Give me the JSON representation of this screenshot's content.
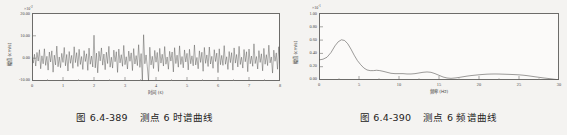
{
  "figures": [
    {
      "caption_number": "图 6.4-389",
      "caption_text": "测点 6 时谱曲线",
      "exponent": "×10",
      "exponent_sup": "-2",
      "chart_data": {
        "type": "line",
        "title": "测点 6 时谱曲线",
        "xlabel": "时间 (s)",
        "ylabel": "幅值 (cm/s)",
        "xlim": [
          0,
          8
        ],
        "ylim": [
          -10,
          20
        ],
        "xticks": [
          0,
          1,
          2,
          3,
          4,
          5,
          6,
          7,
          8
        ],
        "xtick_labels": [
          "0",
          "1",
          "2",
          "3",
          "4",
          "5",
          "6",
          "7",
          "8"
        ],
        "yticks": [
          -10,
          0,
          10,
          20
        ],
        "ytick_labels": [
          "-10.00",
          "0.00",
          "10.00",
          "20.00"
        ],
        "y_scale_note": "×10^-2",
        "grid": false,
        "legend": "none",
        "description": "Dense random vibration time history oscillating about zero, typical band roughly -6 to +6, with occasional spikes reaching about +10 near t=2.0 and t=3.6 and about -10 near t=3.65 and t=3.85.",
        "series": [
          {
            "name": "速度时程",
            "color": "#4f4e4d",
            "x": [
              0.0,
              0.04,
              0.08,
              0.12,
              0.16,
              0.2,
              0.24,
              0.28,
              0.32,
              0.36,
              0.4,
              0.44,
              0.48,
              0.52,
              0.56,
              0.6,
              0.64,
              0.68,
              0.72,
              0.76,
              0.8,
              0.84,
              0.88,
              0.92,
              0.96,
              1.0,
              1.04,
              1.08,
              1.12,
              1.16,
              1.2,
              1.24,
              1.28,
              1.32,
              1.36,
              1.4,
              1.44,
              1.48,
              1.52,
              1.56,
              1.6,
              1.64,
              1.68,
              1.72,
              1.76,
              1.8,
              1.84,
              1.88,
              1.92,
              1.96,
              2.0,
              2.04,
              2.08,
              2.12,
              2.16,
              2.2,
              2.24,
              2.28,
              2.32,
              2.36,
              2.4,
              2.44,
              2.48,
              2.52,
              2.56,
              2.6,
              2.64,
              2.68,
              2.72,
              2.76,
              2.8,
              2.84,
              2.88,
              2.92,
              2.96,
              3.0,
              3.04,
              3.08,
              3.12,
              3.16,
              3.2,
              3.24,
              3.28,
              3.32,
              3.36,
              3.4,
              3.44,
              3.48,
              3.52,
              3.56,
              3.6,
              3.64,
              3.68,
              3.72,
              3.76,
              3.8,
              3.84,
              3.88,
              3.92,
              3.96,
              4.0,
              4.04,
              4.08,
              4.12,
              4.16,
              4.2,
              4.24,
              4.28,
              4.32,
              4.36,
              4.4,
              4.44,
              4.48,
              4.52,
              4.56,
              4.6,
              4.64,
              4.68,
              4.72,
              4.76,
              4.8,
              4.84,
              4.88,
              4.92,
              4.96,
              5.0,
              5.04,
              5.08,
              5.12,
              5.16,
              5.2,
              5.24,
              5.28,
              5.32,
              5.36,
              5.4,
              5.44,
              5.48,
              5.52,
              5.56,
              5.6,
              5.64,
              5.68,
              5.72,
              5.76,
              5.8,
              5.84,
              5.88,
              5.92,
              5.96,
              6.0,
              6.04,
              6.08,
              6.12,
              6.16,
              6.2,
              6.24,
              6.28,
              6.32,
              6.36,
              6.4,
              6.44,
              6.48,
              6.52,
              6.56,
              6.6,
              6.64,
              6.68,
              6.72,
              6.76,
              6.8,
              6.84,
              6.88,
              6.92,
              6.96,
              7.0,
              7.04,
              7.08,
              7.12,
              7.16,
              7.2,
              7.24,
              7.28,
              7.32,
              7.36,
              7.4,
              7.44,
              7.48,
              7.52,
              7.56,
              7.6,
              7.64,
              7.68,
              7.72,
              7.76,
              7.8,
              7.84,
              7.88,
              7.92,
              7.96,
              8.0
            ],
            "y": [
              0.4,
              -2.1,
              1.8,
              -3.4,
              2.6,
              -1.2,
              3.8,
              -4.6,
              1.1,
              -2.4,
              4.2,
              -3.1,
              0.9,
              -5.2,
              2.8,
              -1.6,
              3.3,
              -6.1,
              1.4,
              -2.9,
              5.4,
              -3.7,
              0.6,
              -4.1,
              2.2,
              -1.8,
              4.8,
              -3.3,
              1.7,
              -5.6,
              3.0,
              -2.2,
              1.3,
              -4.4,
              5.1,
              -1.9,
              2.5,
              -3.6,
              4.0,
              -2.7,
              0.8,
              -4.9,
              3.4,
              -1.4,
              2.0,
              -5.3,
              4.5,
              -2.6,
              1.0,
              -3.8,
              10.2,
              -4.2,
              2.3,
              -6.4,
              3.1,
              -1.1,
              4.6,
              -3.0,
              1.9,
              -5.0,
              2.7,
              -2.3,
              5.3,
              -3.9,
              0.5,
              -4.3,
              3.6,
              -1.5,
              2.9,
              -6.2,
              4.1,
              -2.0,
              1.6,
              -3.5,
              5.7,
              -2.8,
              0.7,
              -4.7,
              3.2,
              -1.3,
              2.4,
              -5.4,
              4.3,
              -2.5,
              1.2,
              -3.2,
              6.0,
              -4.0,
              2.1,
              -9.8,
              10.4,
              -2.4,
              1.5,
              -3.7,
              -9.9,
              4.9,
              -2.9,
              0.9,
              -4.5,
              3.5,
              -1.7,
              2.6,
              -5.8,
              4.4,
              -2.1,
              1.8,
              -3.4,
              5.2,
              -2.6,
              0.6,
              -4.8,
              3.1,
              -1.2,
              2.8,
              -6.0,
              4.7,
              -2.3,
              1.4,
              -3.9,
              5.5,
              -2.7,
              0.8,
              -4.2,
              3.7,
              -1.6,
              2.2,
              -5.1,
              4.0,
              -2.4,
              1.1,
              -3.3,
              5.9,
              -2.9,
              0.4,
              -4.6,
              3.3,
              -1.8,
              2.7,
              -5.7,
              4.8,
              -2.2,
              1.5,
              -3.6,
              5.0,
              -2.5,
              0.9,
              -4.4,
              3.8,
              -1.4,
              2.3,
              -6.3,
              4.2,
              -2.8,
              1.3,
              -3.1,
              5.6,
              -2.6,
              0.7,
              -4.9,
              3.0,
              -1.9,
              2.5,
              -5.2,
              4.6,
              -2.1,
              1.7,
              -3.8,
              5.3,
              -2.7,
              0.5,
              -4.3,
              3.9,
              -1.5,
              2.9,
              -5.9,
              4.1,
              -2.4,
              1.0,
              -3.5,
              6.4,
              -2.3,
              0.8,
              -4.7,
              3.4,
              -1.8,
              2.0,
              -5.5,
              4.4,
              -2.6,
              1.6,
              -3.2,
              5.8,
              -2.0,
              0.6,
              -6.5,
              3.6,
              -1.3,
              2.4,
              -4.8,
              5.1,
              -2.2,
              1.2,
              -3.7,
              2.8,
              -0.9,
              1.9,
              -2.5,
              0.3
            ]
          }
        ]
      }
    },
    {
      "caption_number": "图 6.4-390",
      "caption_text": "测点 6 频谱曲线",
      "exponent": "×10",
      "exponent_sup": "-1",
      "chart_data": {
        "type": "line",
        "title": "测点 6 频谱曲线",
        "xlabel": "频率 (Hz)",
        "ylabel": "幅值 (cm/s)",
        "xlim": [
          0,
          30
        ],
        "ylim": [
          0,
          1.0
        ],
        "xticks": [
          0,
          5,
          10,
          15,
          20,
          25,
          30
        ],
        "xtick_labels": [
          "0",
          "5",
          "10",
          "15",
          "20",
          "25",
          "30"
        ],
        "yticks": [
          0.0,
          0.2,
          0.4,
          0.6,
          0.8,
          1.0
        ],
        "ytick_labels": [
          "0.00",
          "0.20",
          "0.40",
          "0.60",
          "0.80",
          "1.00"
        ],
        "y_scale_note": "×10^-1",
        "grid": false,
        "legend": "none",
        "description": "Fourier amplitude spectrum: starts at about 0.30 at 0 Hz, rises to a dominant peak of about 0.60 near 2.8 Hz, falls steeply to about 0.14 by 6 Hz, small secondary bumps near 7 Hz and a clearer local peak about 0.12 near 13.5 Hz, a minimum about 0.02 near 16 Hz, then a broad low rise to about 0.09 between 21 and 24 Hz before decaying to near 0.01 at 30 Hz.",
        "series": [
          {
            "name": "频谱幅值",
            "color": "#5a5958",
            "x": [
              0.0,
              0.5,
              1.0,
              1.5,
              2.0,
              2.4,
              2.8,
              3.2,
              3.6,
              4.0,
              4.4,
              4.8,
              5.2,
              5.6,
              6.0,
              6.4,
              6.8,
              7.2,
              7.6,
              8.0,
              8.5,
              9.0,
              9.5,
              10.0,
              10.5,
              11.0,
              11.5,
              12.0,
              12.5,
              13.0,
              13.5,
              14.0,
              14.5,
              15.0,
              15.5,
              16.0,
              16.5,
              17.0,
              17.5,
              18.0,
              18.5,
              19.0,
              19.5,
              20.0,
              20.5,
              21.0,
              21.5,
              22.0,
              22.5,
              23.0,
              23.5,
              24.0,
              24.5,
              25.0,
              25.5,
              26.0,
              26.5,
              27.0,
              27.5,
              28.0,
              28.5,
              29.0,
              29.5,
              30.0
            ],
            "y": [
              0.3,
              0.31,
              0.34,
              0.41,
              0.51,
              0.57,
              0.6,
              0.59,
              0.54,
              0.46,
              0.37,
              0.29,
              0.23,
              0.18,
              0.15,
              0.14,
              0.14,
              0.145,
              0.14,
              0.13,
              0.115,
              0.1,
              0.095,
              0.095,
              0.095,
              0.09,
              0.09,
              0.095,
              0.105,
              0.115,
              0.12,
              0.115,
              0.095,
              0.07,
              0.045,
              0.03,
              0.025,
              0.03,
              0.038,
              0.048,
              0.058,
              0.066,
              0.072,
              0.078,
              0.083,
              0.087,
              0.089,
              0.09,
              0.089,
              0.087,
              0.085,
              0.083,
              0.08,
              0.077,
              0.072,
              0.065,
              0.057,
              0.048,
              0.04,
              0.032,
              0.025,
              0.018,
              0.01,
              0.004
            ]
          }
        ]
      }
    }
  ]
}
